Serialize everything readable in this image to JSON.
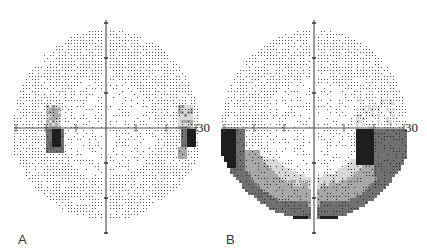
{
  "figure": {
    "type": "visual-field-grayscale-plots",
    "panels": [
      {
        "id": "A",
        "label": "A",
        "axis_max_label": "30",
        "center": [
          106,
          128
        ],
        "scale_px_per_10deg": 30,
        "field_radius_deg": 30,
        "description": "Largely normal field with defects near blind spot and nasal-temporal edge of horizontal meridian (inferior)",
        "defects": [
          {
            "region": "left-of-center below meridian",
            "cx_deg": -17,
            "cy_deg": -2,
            "w_deg": 6,
            "h_deg": 8,
            "level": 4
          },
          {
            "region": "left-of-center above meridian",
            "cx_deg": -18,
            "cy_deg": 2,
            "w_deg": 3,
            "h_deg": 4,
            "level": 2
          },
          {
            "region": "right edge below meridian",
            "cx_deg": 27,
            "cy_deg": -2,
            "w_deg": 3,
            "h_deg": 5,
            "level": 4
          },
          {
            "region": "right edge above meridian",
            "cx_deg": 27,
            "cy_deg": 3,
            "w_deg": 3,
            "h_deg": 4,
            "level": 2
          }
        ]
      },
      {
        "id": "B",
        "label": "B",
        "axis_max_label": "30",
        "center": [
          314,
          128
        ],
        "scale_px_per_10deg": 30,
        "field_radius_deg": 30,
        "description": "Inferior arcuate defects with dense loss along inferior periphery",
        "defects": [
          {
            "region": "left periphery inferior",
            "level": 4
          },
          {
            "region": "right periphery inferior",
            "level": 4
          },
          {
            "region": "inferior arc",
            "level": 3
          },
          {
            "region": "bottom periphery",
            "level": 4
          }
        ]
      }
    ],
    "gray_levels": [
      "#ffffff",
      "#d8d8d8",
      "#a8a8a8",
      "#707070",
      "#1e1e1e"
    ]
  }
}
